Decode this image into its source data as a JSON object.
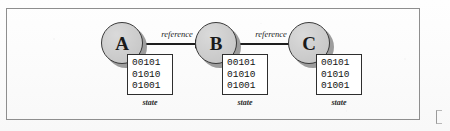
{
  "figure": {
    "frame_color": "#8e8e8e",
    "background_color": "#fdfdfd"
  },
  "diagram": {
    "type": "node-link",
    "node_fill": "#cfcfcf",
    "node_stroke": "#3a3a3a",
    "box_stroke": "#2e2e2e",
    "arrow_color": "#1e1e1e",
    "nodes": [
      {
        "id": "A",
        "label": "A",
        "state_caption": "state",
        "state_rows": [
          "00101",
          "01010",
          "01001"
        ]
      },
      {
        "id": "B",
        "label": "B",
        "state_caption": "state",
        "state_rows": [
          "00101",
          "01010",
          "01001"
        ]
      },
      {
        "id": "C",
        "label": "C",
        "state_caption": "state",
        "state_rows": [
          "00101",
          "01010",
          "01001"
        ]
      }
    ],
    "edges": [
      {
        "from": "A",
        "to": "B",
        "label": "reference"
      },
      {
        "from": "B",
        "to": "C",
        "label": "reference"
      }
    ]
  }
}
